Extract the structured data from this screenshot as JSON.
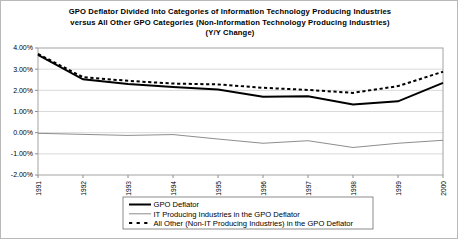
{
  "chart_data": {
    "type": "line",
    "title": "GPO Deflator Divided Into Categories of Information Technology Producing Industries versus All Other GPO Categories (Non-Information Technology Producing Industries) (Y/Y Change)",
    "title_lines": [
      "GPO Deflator Divided Into Categories of Information Technology Producing Industries",
      "versus All Other GPO Categories (Non-Information Technology Producing Industries)",
      "(Y/Y Change)"
    ],
    "xlabel": "",
    "ylabel": "",
    "categories": [
      "1991",
      "1992",
      "1993",
      "1994",
      "1995",
      "1996",
      "1997",
      "1998",
      "1999",
      "2000"
    ],
    "x": [
      1991,
      1992,
      1993,
      1994,
      1995,
      1996,
      1997,
      1998,
      1999,
      2000
    ],
    "ylim": [
      -2.0,
      4.0
    ],
    "ytick_values": [
      4.0,
      3.0,
      2.0,
      1.0,
      0.0,
      -1.0,
      -2.0
    ],
    "ytick_labels": [
      "4.00%",
      "3.00%",
      "2.00%",
      "1.00%",
      "0.00%",
      "-1.00%",
      "-2.00%"
    ],
    "grid": true,
    "grid_axis": "y",
    "legend_position": "bottom",
    "units": "percent",
    "series": [
      {
        "name": "GPO Deflator",
        "style": "solid-thick",
        "color": "#000000",
        "values": [
          3.68,
          2.52,
          2.3,
          2.16,
          2.04,
          1.7,
          1.72,
          1.33,
          1.48,
          2.35
        ]
      },
      {
        "name": "IT Producing Industries in the GPO Deflator",
        "style": "solid-thin",
        "color": "#808080",
        "values": [
          -0.03,
          -0.08,
          -0.13,
          -0.09,
          -0.3,
          -0.5,
          -0.38,
          -0.7,
          -0.5,
          -0.36
        ]
      },
      {
        "name": "All Other (Non-IT Producing Industries) in the GPO Deflator",
        "style": "dashed",
        "color": "#000000",
        "values": [
          3.72,
          2.62,
          2.45,
          2.32,
          2.28,
          2.12,
          2.02,
          1.88,
          2.2,
          2.88
        ]
      }
    ]
  },
  "legend": {
    "items": [
      {
        "label": "GPO Deflator",
        "style": "solid-thick"
      },
      {
        "label": "IT Producing Industries in the GPO Deflator",
        "style": "solid-thin"
      },
      {
        "label": "All Other (Non-IT Producing Industries) in the GPO Deflator",
        "style": "dashed"
      }
    ]
  }
}
